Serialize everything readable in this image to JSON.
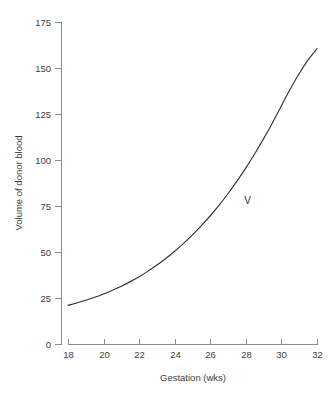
{
  "chart_data": {
    "type": "line",
    "title": "",
    "subtitle": "",
    "xlabel": "Gestation (wks)",
    "ylabel": "Volume of donor blood",
    "xlim": [
      18,
      32
    ],
    "ylim": [
      0,
      175
    ],
    "xticks": [
      18,
      20,
      22,
      24,
      26,
      28,
      30,
      32
    ],
    "yticks": [
      0,
      25,
      50,
      75,
      100,
      125,
      150,
      175
    ],
    "xtick_labels": [
      "18",
      "20",
      "22",
      "24",
      "26",
      "28",
      "30",
      "32"
    ],
    "ytick_labels": [
      "0",
      "25",
      "50",
      "75",
      "100",
      "125",
      "150",
      "175"
    ],
    "grid": false,
    "legend": null,
    "legend_position": "none",
    "annotations": [
      {
        "text": "V",
        "x": 28.1,
        "y": 78
      }
    ],
    "series": [
      {
        "name": "V",
        "label": "V",
        "color": "#333333",
        "x": [
          18.0,
          18.5,
          19.0,
          19.5,
          20.0,
          20.5,
          21.0,
          21.5,
          22.0,
          22.5,
          23.0,
          23.5,
          24.0,
          24.5,
          25.0,
          25.5,
          26.0,
          26.5,
          27.0,
          27.5,
          28.0,
          28.5,
          29.0,
          29.5,
          30.0,
          30.5,
          31.0,
          31.5,
          32.0
        ],
        "y": [
          21.0,
          22.3,
          23.8,
          25.4,
          27.2,
          29.2,
          31.4,
          33.9,
          36.6,
          39.6,
          42.9,
          46.5,
          50.4,
          54.7,
          59.3,
          64.3,
          69.7,
          75.5,
          81.8,
          88.5,
          95.7,
          103.4,
          111.6,
          120.3,
          129.5,
          138.6,
          147.0,
          154.4,
          160.5
        ]
      }
    ]
  },
  "axes": {
    "y_axis_name": "volume-axis",
    "x_axis_name": "gestation-axis"
  }
}
